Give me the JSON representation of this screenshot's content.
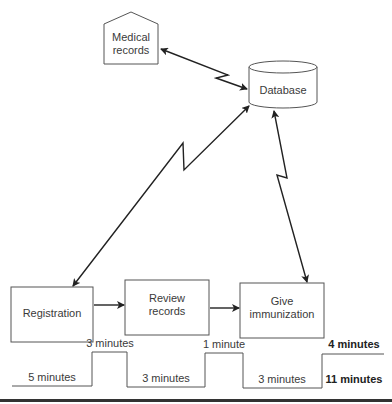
{
  "diagram": {
    "nodes": {
      "medical_records": {
        "line1": "Medical",
        "line2": "records",
        "shape": "pentagon-house"
      },
      "database": {
        "label": "Database",
        "shape": "cylinder"
      },
      "registration": {
        "label": "Registration",
        "shape": "rectangle"
      },
      "review_records": {
        "line1": "Review",
        "line2": "records",
        "shape": "rectangle"
      },
      "give_immunization": {
        "line1": "Give",
        "line2": "immunization",
        "shape": "rectangle"
      }
    },
    "edges": [
      {
        "from": "medical_records",
        "to": "database",
        "style": "lightning-bidirectional"
      },
      {
        "from": "registration",
        "to": "database",
        "style": "lightning-bidirectional"
      },
      {
        "from": "give_immunization",
        "to": "database",
        "style": "lightning-bidirectional"
      },
      {
        "from": "registration",
        "to": "review_records",
        "style": "arrow"
      },
      {
        "from": "review_records",
        "to": "give_immunization",
        "style": "arrow"
      }
    ],
    "timeline": {
      "low": [
        "5 minutes",
        "3 minutes",
        "3 minutes"
      ],
      "high": [
        "3 minutes",
        "1 minute"
      ],
      "total_high": "4 minutes",
      "total_low": "11 minutes"
    }
  }
}
